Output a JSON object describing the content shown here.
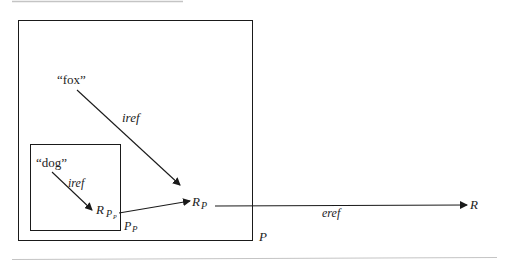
{
  "diagram": {
    "colors": {
      "stroke": "#1a1a1a",
      "rule": "#bdbdbd",
      "text": "#222222",
      "background": "#ffffff"
    },
    "outer_box": {
      "label": "P"
    },
    "inner_box": {
      "label_main": "P",
      "label_sub": "P"
    },
    "nodes": {
      "fox": {
        "text": "“fox”"
      },
      "dog": {
        "text": "“dog”"
      },
      "r_pp": {
        "main": "R",
        "sub": "P",
        "subsub": "P"
      },
      "r_p": {
        "main": "R",
        "sub": "P"
      },
      "r": {
        "text": "R"
      }
    },
    "edges": [
      {
        "from": "fox",
        "to": "r_p",
        "label": "iref"
      },
      {
        "from": "dog",
        "to": "r_pp",
        "label": "iref"
      },
      {
        "from": "r_pp",
        "to": "r_p",
        "label": ""
      },
      {
        "from": "r_p",
        "to": "r",
        "label": "eref"
      }
    ]
  }
}
